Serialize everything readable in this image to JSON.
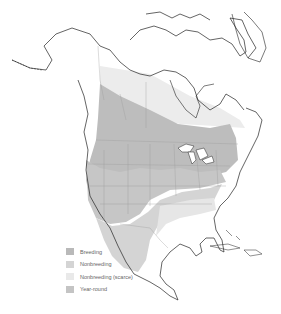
{
  "map": {
    "region": "North America",
    "legend": [
      {
        "label": "Breeding",
        "color": "#b9b9b9"
      },
      {
        "label": "Nonbreeding",
        "color": "#d4d4d4"
      },
      {
        "label": "Nonbreeding (scarce)",
        "color": "#e9e9e9"
      },
      {
        "label": "Year-round",
        "color": "#c4c4c4"
      }
    ],
    "colors": {
      "land": "#ffffff",
      "outline": "#222222",
      "borders": "#9a9a9a",
      "breeding": "#b9b9b9",
      "yearround": "#c4c4c4",
      "nonbreeding": "#d4d4d4",
      "scarce": "#e9e9e9"
    }
  }
}
